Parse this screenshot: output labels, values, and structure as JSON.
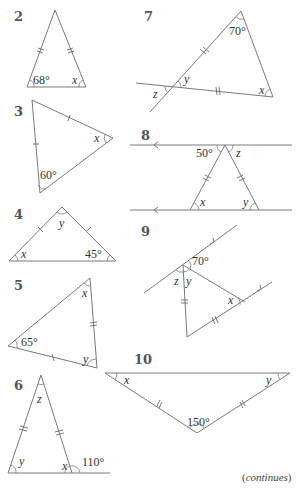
{
  "problems": [
    {
      "number": "2",
      "angles": {
        "given": "68°",
        "unknown": "x"
      }
    },
    {
      "number": "3",
      "angles": {
        "given": "60°",
        "unknown": "x"
      }
    },
    {
      "number": "4",
      "angles": {
        "given": "45°",
        "unknowns": [
          "x",
          "y"
        ]
      }
    },
    {
      "number": "5",
      "angles": {
        "given": "65°",
        "unknowns": [
          "x",
          "y"
        ]
      }
    },
    {
      "number": "6",
      "angles": {
        "given": "110°",
        "unknowns": [
          "x",
          "y",
          "z"
        ]
      }
    },
    {
      "number": "7",
      "angles": {
        "given": "70°",
        "unknowns": [
          "x",
          "y",
          "z"
        ]
      }
    },
    {
      "number": "8",
      "angles": {
        "given": "50°",
        "unknowns": [
          "x",
          "y",
          "z"
        ]
      }
    },
    {
      "number": "9",
      "angles": {
        "given": "70°",
        "unknowns": [
          "x",
          "y",
          "z"
        ]
      }
    },
    {
      "number": "10",
      "angles": {
        "given": "150°",
        "unknowns": [
          "x",
          "y"
        ]
      }
    }
  ],
  "labels": {
    "p2": {
      "num": "2",
      "a": "68°",
      "x": "x"
    },
    "p3": {
      "num": "3",
      "a": "60°",
      "x": "x"
    },
    "p4": {
      "num": "4",
      "a": "45°",
      "x": "x",
      "y": "y"
    },
    "p5": {
      "num": "5",
      "a": "65°",
      "x": "x",
      "y": "y"
    },
    "p6": {
      "num": "6",
      "a": "110°",
      "x": "x",
      "y": "y",
      "z": "z"
    },
    "p7": {
      "num": "7",
      "a": "70°",
      "x": "x",
      "y": "y",
      "z": "z"
    },
    "p8": {
      "num": "8",
      "a": "50°",
      "x": "x",
      "y": "y",
      "z": "z"
    },
    "p9": {
      "num": "9",
      "a": "70°",
      "x": "x",
      "y": "y",
      "z": "z"
    },
    "p10": {
      "num": "10",
      "a": "150°",
      "x": "x",
      "y": "y"
    }
  },
  "footer": {
    "continues": "continues",
    "open": "(",
    "close": ")"
  }
}
